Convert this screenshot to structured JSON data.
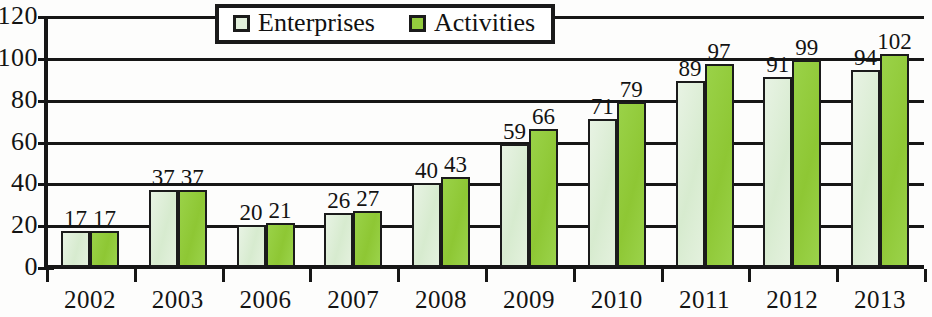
{
  "chart_data": {
    "type": "bar",
    "title": "",
    "subtitle": "",
    "xlabel": "",
    "ylabel": "",
    "ylim": [
      0,
      120
    ],
    "y_ticks": [
      0,
      20,
      40,
      60,
      80,
      100,
      120
    ],
    "grid": true,
    "legend_position": "top-center",
    "categories": [
      "2002",
      "2003",
      "2006",
      "2007",
      "2008",
      "2009",
      "2010",
      "2011",
      "2012",
      "2013"
    ],
    "series": [
      {
        "name": "Enterprises",
        "color": "#ddeed6",
        "values": [
          17,
          37,
          20,
          26,
          40,
          59,
          71,
          89,
          91,
          94
        ]
      },
      {
        "name": "Activities",
        "color": "#93cc3e",
        "values": [
          17,
          37,
          21,
          27,
          43,
          66,
          79,
          97,
          99,
          102
        ]
      }
    ]
  },
  "legend": {
    "items": [
      {
        "label": "Enterprises",
        "swatch": "enterprises-swatch"
      },
      {
        "label": "Activities",
        "swatch": "activities-swatch"
      }
    ]
  }
}
